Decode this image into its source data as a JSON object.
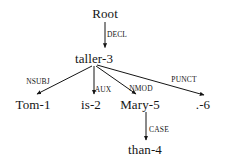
{
  "diagram": {
    "type": "dependency-parse-tree",
    "title": "",
    "sentence": "Tom is taller than Mary .",
    "background_color": "#ffffff",
    "ink_color": "#151515",
    "nodes": [
      {
        "id": "root",
        "label": "Root",
        "x": 105,
        "y": 13,
        "font_size": 13
      },
      {
        "id": "taller",
        "label": "taller-3",
        "x": 94,
        "y": 58,
        "font_size": 13
      },
      {
        "id": "tom",
        "label": "Tom-1",
        "x": 33,
        "y": 104,
        "font_size": 13
      },
      {
        "id": "is",
        "label": "is-2",
        "x": 91,
        "y": 104,
        "font_size": 13
      },
      {
        "id": "mary",
        "label": "Mary-5",
        "x": 140,
        "y": 104,
        "font_size": 13
      },
      {
        "id": "punct",
        "label": ".-6",
        "x": 203,
        "y": 104,
        "font_size": 13
      },
      {
        "id": "than",
        "label": "than-4",
        "x": 145,
        "y": 149,
        "font_size": 13
      }
    ],
    "edges": [
      {
        "id": "e-decl",
        "label": "DECL",
        "from": "root",
        "to": "tom_placeholder_none",
        "head": "Root",
        "dependent": "taller-3",
        "label_x": 117,
        "label_y": 35
      },
      {
        "id": "e-nsubj",
        "label": "NSUBJ",
        "head": "taller-3",
        "dependent": "Tom-1",
        "label_x": 38,
        "label_y": 82
      },
      {
        "id": "e-aux",
        "label": "AUX",
        "head": "taller-3",
        "dependent": "is-2",
        "label_x": 103,
        "label_y": 90
      },
      {
        "id": "e-nmod",
        "label": "NMOD",
        "head": "taller-3",
        "dependent": "Mary-5",
        "label_x": 141,
        "label_y": 89
      },
      {
        "id": "e-punct",
        "label": "PUNCT",
        "head": "taller-3",
        "dependent": ".-6",
        "label_x": 184,
        "label_y": 80
      },
      {
        "id": "e-case",
        "label": "CASE",
        "head": "Mary-5",
        "dependent": "than-4",
        "label_x": 159,
        "label_y": 130
      }
    ]
  }
}
